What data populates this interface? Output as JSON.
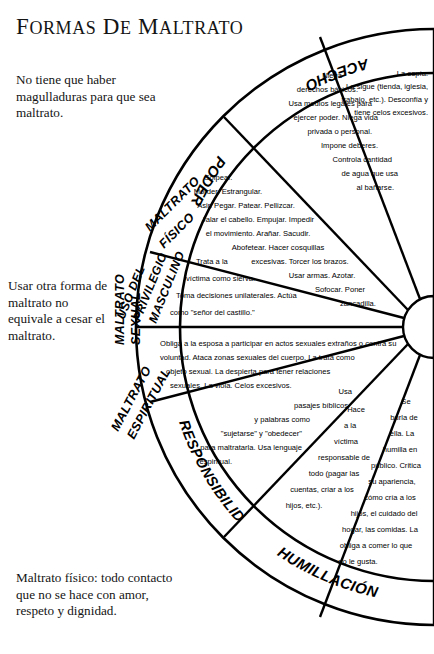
{
  "page": {
    "title_main": "FORMAS DE MALTRATO",
    "title_word_1": "F",
    "title_word_1_rest": "ORMAS",
    "title_word_2": "D",
    "title_word_2_rest": "E",
    "title_word_3": "M",
    "title_word_3_rest": "ALTRATO",
    "background_color": "#ffffff",
    "ink_color": "#000000"
  },
  "notes": {
    "note_1": "No tiene que haber magulladuras para que sea maltrato.",
    "note_2": "Usar otra forma de maltrato no equivale a cesar el maltrato.",
    "note_3": "Maltrato físico: todo contacto que no se hace con amor, respeto y dignidad."
  },
  "diagram": {
    "type": "half-wheel",
    "hub_label": "",
    "sectors": [
      {
        "id": "acecho",
        "rim_label": "ACECHO",
        "body": "La espía. La sigue (tienda, iglesia, trabajo, etc.). Desconfía y tiene celos excesivos.",
        "body_lines": [
          "La espía.",
          "La sigue (tienda, iglesia,",
          "trabajo, etc.). Desconfía y",
          "tiene celos excesivos."
        ]
      },
      {
        "id": "poder",
        "rim_label": "PODER",
        "body": "Niega derechos básicos. Usa medios legales para ejercer poder. Niega vida privada o personal. Impone deberes. Controla cantidad de agua que usa al bañarse.",
        "body_lines": [
          "Niega",
          "derechos básicos.",
          "Usa medios legales para",
          "ejercer poder. Niega vida",
          "privada o personal.",
          "Impone deberes.",
          "Controla cantidad",
          "de agua que usa",
          "al bañarse."
        ]
      },
      {
        "id": "maltrato-fisico",
        "rim_label": "MALTRATO FÍSICO",
        "rim_label_line_1": "MALTRATO",
        "rim_label_line_2": "FÍSICO",
        "body": "Golpear. Morder. Estrangular. Asir. Pegar. Patear. Pellizcar. Jalar el cabello. Empujar. Impedir el movimiento. Arañar. Sacudir. Abofetear. Hacer cosquillas excesivas. Torcer los brazos. Usar armas. Azotar. Sofocar. Poner zancadilla.",
        "body_lines": [
          "Golpear.",
          "Morder. Estrangular.",
          "Asir. Pegar. Patear. Pellizcar.",
          "Jalar el cabello. Empujar. Impedir",
          "el movimiento. Arañar. Sacudir.",
          "Abofetear. Hacer cosquillas",
          "excesivas. Torcer los brazos.",
          "Usar armas. Azotar.",
          "Sofocar. Poner",
          "zancadilla."
        ]
      },
      {
        "id": "privilegio-masculino",
        "rim_label": "USO DEL PRIVILEGIO MASCULINO",
        "rim_label_line_1": "USO DEL",
        "rim_label_line_2": "PRIVILEGIO",
        "rim_label_line_3": "MASCULINO",
        "body": "Trata a la víctima como sierva. Toma decisiones unilaterales. Actúa como \"señor del castillo.\"",
        "body_lines": [
          "Trata a la",
          "víctima como sierva.",
          "Toma decisiones unilaterales. Actúa",
          "como \"señor del castillo.\""
        ]
      },
      {
        "id": "maltrato-sexual",
        "rim_label": "MALTRATO SEXUAL",
        "rim_label_line_1": "MALTRATO",
        "rim_label_line_2": "SEXUAL",
        "body": "Obliga a la esposa a participar en actos sexuales extraños o contra su voluntad. Ataca zonas sexuales del cuerpo. La trata como objeto sexual. La despierta para tener relaciones sexuales. La viola. Celos excesivos.",
        "body_lines": [
          "Obliga a la esposa a participar en actos sexuales extraños o contra su",
          "voluntad. Ataca zonas sexuales del cuerpo. La trata como",
          "objeto sexual. La despierta para tener relaciones",
          "sexuales. La viola. Celos excesivos."
        ]
      },
      {
        "id": "maltrato-espiritual",
        "rim_label": "MALTRATO ESPIRITUAL",
        "rim_label_line_1": "MALTRATO",
        "rim_label_line_2": "ESPIRITUAL",
        "body": "Usa pasajes bíblicos y palabras como \"sujetarse\" y \"obedecer\" para maltratarla. Usa lenguaje espiritual.",
        "body_lines": [
          "Usa",
          "pasajes bíblicos",
          "y palabras como",
          "\"sujetarse\" y \"obedecer\"",
          "para maltratarla. Usa lenguaje",
          "espiritual."
        ]
      },
      {
        "id": "responsibilidad",
        "rim_label": "RESPONSIBILIDAD",
        "body": "Hace a la víctima responsable de todo (pagar las cuentas, criar a los hijos, etc.).",
        "body_lines": [
          "Hace",
          "a la",
          "víctima",
          "responsable de",
          "todo (pagar las",
          "cuentas, criar a los",
          "hijos, etc.)."
        ]
      },
      {
        "id": "humillacion",
        "rim_label": "HUMILLACIÓN",
        "body": "Se burla de ella. La humilla en público. Critica su apariencia, cómo cría a los hijos, el cuidado del hogar, las comidas. La obliga a comer lo que no le gusta.",
        "body_lines": [
          "Se",
          "burla de",
          "ella. La",
          "humilla en",
          "público. Critica",
          "su apariencia,",
          "cómo cría a los",
          "hijos, el cuidado del",
          "hogar, las comidas. La",
          "obliga a comer lo que",
          "no le gusta."
        ]
      }
    ]
  }
}
